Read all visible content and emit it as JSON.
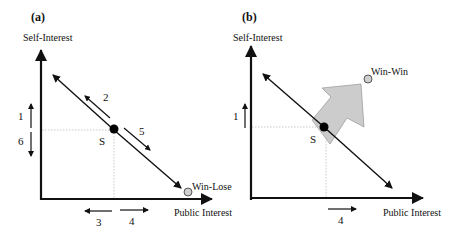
{
  "panels": {
    "a": {
      "label": "(a)",
      "y_axis_label": "Self-Interest",
      "x_axis_label": "Public Interest",
      "point_label": "S",
      "outcome_label": "Win-Lose",
      "arrows": {
        "up": "1",
        "along_up": "2",
        "left": "3",
        "right": "4",
        "along_down": "5",
        "down": "6"
      }
    },
    "b": {
      "label": "(b)",
      "y_axis_label": "Self-Interest",
      "x_axis_label": "Public Interest",
      "point_label": "S",
      "outcome_label": "Win-Win",
      "arrows": {
        "up": "1",
        "right": "4"
      }
    }
  },
  "colors": {
    "line": "#111111",
    "dot": "#000000",
    "outcome_circle_fill": "#cfcfcf",
    "big_arrow_fill": "#cccccc",
    "dotted_guide": "#bbbbbb"
  }
}
